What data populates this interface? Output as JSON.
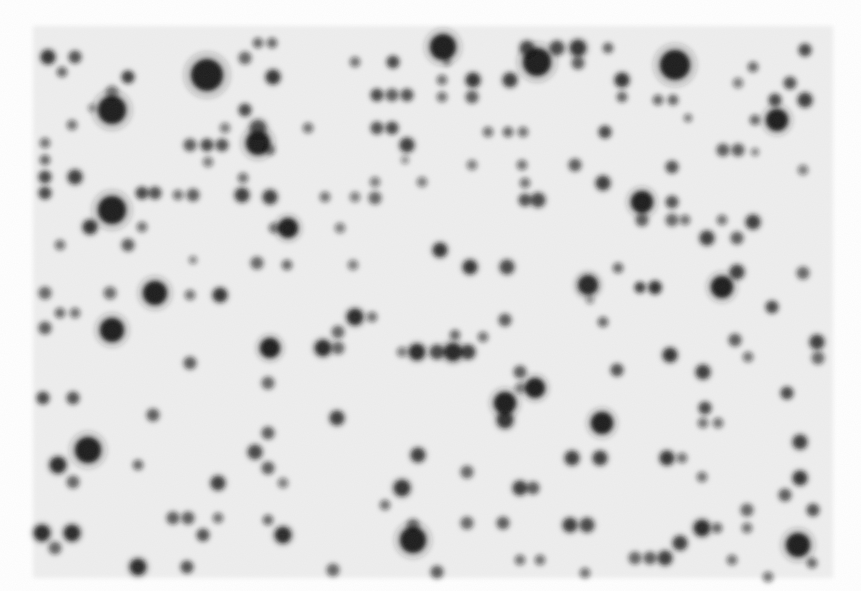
{
  "image": {
    "width": 861,
    "height": 591,
    "page_background": "#ffffff",
    "membrane": {
      "x": 33,
      "y": 26,
      "width": 800,
      "height": 552,
      "color": "#eeeeee"
    },
    "spot_color": "#1a1a1a",
    "spots": [
      [
        48,
        57,
        7,
        0.85
      ],
      [
        75,
        57,
        6,
        0.7
      ],
      [
        62,
        72,
        5,
        0.55
      ],
      [
        128,
        77,
        6,
        0.8
      ],
      [
        207,
        75,
        16,
        1.0
      ],
      [
        245,
        58,
        6,
        0.6
      ],
      [
        258,
        43,
        5,
        0.55
      ],
      [
        272,
        43,
        5,
        0.55
      ],
      [
        273,
        77,
        7,
        0.85
      ],
      [
        112,
        110,
        14,
        1.0
      ],
      [
        112,
        92,
        6,
        0.5
      ],
      [
        92,
        108,
        4,
        0.35
      ],
      [
        72,
        125,
        5,
        0.5
      ],
      [
        245,
        110,
        6,
        0.75
      ],
      [
        190,
        145,
        6,
        0.65
      ],
      [
        207,
        145,
        6,
        0.75
      ],
      [
        225,
        128,
        5,
        0.45
      ],
      [
        222,
        145,
        6,
        0.7
      ],
      [
        258,
        143,
        12,
        1.0
      ],
      [
        258,
        128,
        8,
        0.7
      ],
      [
        270,
        150,
        5,
        0.5
      ],
      [
        208,
        162,
        5,
        0.45
      ],
      [
        45,
        143,
        5,
        0.5
      ],
      [
        45,
        160,
        5,
        0.55
      ],
      [
        45,
        177,
        6,
        0.75
      ],
      [
        75,
        177,
        7,
        0.8
      ],
      [
        45,
        193,
        6,
        0.75
      ],
      [
        112,
        210,
        14,
        1.0
      ],
      [
        90,
        227,
        7,
        0.85
      ],
      [
        142,
        193,
        6,
        0.75
      ],
      [
        155,
        193,
        6,
        0.7
      ],
      [
        178,
        195,
        5,
        0.5
      ],
      [
        193,
        195,
        6,
        0.65
      ],
      [
        242,
        195,
        7,
        0.8
      ],
      [
        243,
        178,
        5,
        0.5
      ],
      [
        128,
        245,
        6,
        0.65
      ],
      [
        142,
        227,
        5,
        0.5
      ],
      [
        60,
        245,
        5,
        0.5
      ],
      [
        155,
        293,
        12,
        1.0
      ],
      [
        220,
        295,
        7,
        0.85
      ],
      [
        190,
        295,
        5,
        0.5
      ],
      [
        110,
        293,
        6,
        0.55
      ],
      [
        45,
        293,
        6,
        0.6
      ],
      [
        193,
        260,
        4,
        0.4
      ],
      [
        270,
        197,
        7,
        0.8
      ],
      [
        288,
        228,
        10,
        1.0
      ],
      [
        274,
        228,
        5,
        0.5
      ],
      [
        325,
        197,
        5,
        0.5
      ],
      [
        355,
        197,
        5,
        0.45
      ],
      [
        375,
        198,
        6,
        0.6
      ],
      [
        375,
        182,
        5,
        0.45
      ],
      [
        422,
        182,
        5,
        0.45
      ],
      [
        340,
        228,
        5,
        0.45
      ],
      [
        257,
        263,
        6,
        0.6
      ],
      [
        287,
        265,
        5,
        0.55
      ],
      [
        353,
        265,
        5,
        0.45
      ],
      [
        440,
        250,
        7,
        0.85
      ],
      [
        308,
        128,
        5,
        0.5
      ],
      [
        377,
        95,
        6,
        0.75
      ],
      [
        392,
        95,
        6,
        0.65
      ],
      [
        407,
        95,
        6,
        0.7
      ],
      [
        393,
        62,
        6,
        0.75
      ],
      [
        355,
        62,
        5,
        0.5
      ],
      [
        377,
        128,
        6,
        0.7
      ],
      [
        392,
        128,
        6,
        0.75
      ],
      [
        407,
        145,
        7,
        0.8
      ],
      [
        405,
        160,
        4,
        0.35
      ],
      [
        443,
        47,
        13,
        1.0
      ],
      [
        442,
        80,
        5,
        0.5
      ],
      [
        442,
        97,
        5,
        0.5
      ],
      [
        447,
        62,
        4,
        0.35
      ],
      [
        537,
        62,
        14,
        1.0
      ],
      [
        527,
        48,
        7,
        0.75
      ],
      [
        557,
        48,
        7,
        0.75
      ],
      [
        578,
        48,
        8,
        0.85
      ],
      [
        578,
        63,
        6,
        0.65
      ],
      [
        608,
        48,
        5,
        0.6
      ],
      [
        473,
        80,
        7,
        0.85
      ],
      [
        510,
        80,
        7,
        0.8
      ],
      [
        622,
        80,
        7,
        0.85
      ],
      [
        472,
        97,
        6,
        0.65
      ],
      [
        622,
        97,
        5,
        0.6
      ],
      [
        605,
        132,
        6,
        0.75
      ],
      [
        488,
        132,
        5,
        0.5
      ],
      [
        508,
        132,
        5,
        0.55
      ],
      [
        523,
        132,
        5,
        0.5
      ],
      [
        675,
        65,
        15,
        1.0
      ],
      [
        658,
        100,
        5,
        0.55
      ],
      [
        673,
        100,
        5,
        0.6
      ],
      [
        688,
        118,
        4,
        0.45
      ],
      [
        753,
        67,
        5,
        0.55
      ],
      [
        805,
        50,
        6,
        0.75
      ],
      [
        790,
        83,
        6,
        0.7
      ],
      [
        738,
        83,
        5,
        0.45
      ],
      [
        777,
        120,
        11,
        1.0
      ],
      [
        775,
        100,
        6,
        0.75
      ],
      [
        805,
        100,
        7,
        0.8
      ],
      [
        755,
        120,
        5,
        0.55
      ],
      [
        723,
        150,
        6,
        0.65
      ],
      [
        738,
        150,
        6,
        0.65
      ],
      [
        755,
        152,
        4,
        0.4
      ],
      [
        575,
        165,
        6,
        0.65
      ],
      [
        522,
        165,
        5,
        0.5
      ],
      [
        472,
        165,
        5,
        0.45
      ],
      [
        672,
        167,
        6,
        0.7
      ],
      [
        603,
        183,
        7,
        0.8
      ],
      [
        525,
        183,
        5,
        0.5
      ],
      [
        525,
        200,
        6,
        0.7
      ],
      [
        538,
        200,
        7,
        0.75
      ],
      [
        642,
        202,
        11,
        1.0
      ],
      [
        642,
        220,
        6,
        0.65
      ],
      [
        672,
        202,
        6,
        0.7
      ],
      [
        672,
        220,
        6,
        0.6
      ],
      [
        685,
        220,
        5,
        0.5
      ],
      [
        722,
        220,
        5,
        0.5
      ],
      [
        753,
        222,
        7,
        0.8
      ],
      [
        803,
        170,
        5,
        0.45
      ],
      [
        707,
        238,
        7,
        0.8
      ],
      [
        737,
        238,
        6,
        0.65
      ],
      [
        737,
        272,
        7,
        0.8
      ],
      [
        722,
        287,
        11,
        1.0
      ],
      [
        803,
        273,
        6,
        0.6
      ],
      [
        640,
        287,
        5,
        0.55
      ],
      [
        655,
        287,
        6,
        0.65
      ],
      [
        470,
        267,
        7,
        0.85
      ],
      [
        507,
        267,
        7,
        0.75
      ],
      [
        618,
        268,
        5,
        0.55
      ],
      [
        588,
        285,
        10,
        0.95
      ],
      [
        590,
        300,
        4,
        0.35
      ],
      [
        437,
        352,
        7,
        0.75
      ],
      [
        453,
        352,
        9,
        0.95
      ],
      [
        468,
        352,
        7,
        0.8
      ],
      [
        455,
        335,
        5,
        0.55
      ],
      [
        483,
        337,
        5,
        0.5
      ],
      [
        505,
        320,
        6,
        0.65
      ],
      [
        535,
        388,
        10,
        1.0
      ],
      [
        505,
        403,
        11,
        1.0
      ],
      [
        505,
        420,
        8,
        0.85
      ],
      [
        520,
        372,
        6,
        0.65
      ],
      [
        520,
        388,
        5,
        0.45
      ],
      [
        603,
        322,
        5,
        0.55
      ],
      [
        602,
        423,
        11,
        1.0
      ],
      [
        617,
        370,
        6,
        0.7
      ],
      [
        640,
        288,
        5,
        0.5
      ],
      [
        655,
        288,
        6,
        0.6
      ],
      [
        670,
        355,
        7,
        0.85
      ],
      [
        703,
        372,
        7,
        0.8
      ],
      [
        735,
        340,
        6,
        0.65
      ],
      [
        772,
        307,
        6,
        0.75
      ],
      [
        817,
        342,
        7,
        0.8
      ],
      [
        818,
        358,
        6,
        0.6
      ],
      [
        748,
        357,
        5,
        0.5
      ],
      [
        787,
        393,
        6,
        0.75
      ],
      [
        705,
        408,
        6,
        0.75
      ],
      [
        703,
        423,
        5,
        0.5
      ],
      [
        718,
        423,
        5,
        0.5
      ],
      [
        112,
        330,
        12,
        1.0
      ],
      [
        45,
        328,
        6,
        0.65
      ],
      [
        60,
        313,
        5,
        0.55
      ],
      [
        75,
        313,
        5,
        0.5
      ],
      [
        270,
        348,
        10,
        1.0
      ],
      [
        323,
        348,
        8,
        0.9
      ],
      [
        338,
        348,
        6,
        0.6
      ],
      [
        355,
        317,
        8,
        0.9
      ],
      [
        372,
        317,
        5,
        0.5
      ],
      [
        338,
        332,
        6,
        0.6
      ],
      [
        417,
        352,
        8,
        0.9
      ],
      [
        402,
        352,
        5,
        0.45
      ],
      [
        190,
        363,
        6,
        0.65
      ],
      [
        268,
        383,
        6,
        0.6
      ],
      [
        43,
        398,
        6,
        0.75
      ],
      [
        73,
        398,
        6,
        0.7
      ],
      [
        153,
        415,
        6,
        0.65
      ],
      [
        337,
        418,
        7,
        0.8
      ],
      [
        255,
        452,
        7,
        0.75
      ],
      [
        268,
        433,
        6,
        0.65
      ],
      [
        268,
        468,
        6,
        0.65
      ],
      [
        88,
        450,
        13,
        1.0
      ],
      [
        58,
        465,
        8,
        0.9
      ],
      [
        73,
        482,
        6,
        0.6
      ],
      [
        138,
        465,
        5,
        0.55
      ],
      [
        218,
        483,
        7,
        0.8
      ],
      [
        283,
        483,
        5,
        0.45
      ],
      [
        402,
        488,
        8,
        0.85
      ],
      [
        418,
        455,
        7,
        0.8
      ],
      [
        173,
        518,
        6,
        0.65
      ],
      [
        188,
        518,
        6,
        0.65
      ],
      [
        203,
        535,
        6,
        0.7
      ],
      [
        218,
        518,
        5,
        0.5
      ],
      [
        42,
        533,
        8,
        0.9
      ],
      [
        72,
        533,
        8,
        0.9
      ],
      [
        55,
        548,
        6,
        0.6
      ],
      [
        283,
        535,
        8,
        0.9
      ],
      [
        268,
        520,
        5,
        0.55
      ],
      [
        385,
        505,
        5,
        0.5
      ],
      [
        413,
        540,
        13,
        1.0
      ],
      [
        413,
        525,
        6,
        0.55
      ],
      [
        138,
        567,
        8,
        0.9
      ],
      [
        187,
        567,
        6,
        0.7
      ],
      [
        333,
        570,
        6,
        0.6
      ],
      [
        437,
        572,
        6,
        0.65
      ],
      [
        572,
        458,
        7,
        0.8
      ],
      [
        600,
        458,
        7,
        0.8
      ],
      [
        667,
        458,
        7,
        0.85
      ],
      [
        682,
        458,
        5,
        0.5
      ],
      [
        800,
        442,
        7,
        0.8
      ],
      [
        800,
        478,
        7,
        0.85
      ],
      [
        785,
        495,
        6,
        0.65
      ],
      [
        813,
        510,
        6,
        0.7
      ],
      [
        747,
        510,
        6,
        0.6
      ],
      [
        467,
        472,
        6,
        0.6
      ],
      [
        520,
        488,
        7,
        0.8
      ],
      [
        533,
        488,
        6,
        0.65
      ],
      [
        503,
        523,
        6,
        0.65
      ],
      [
        467,
        523,
        6,
        0.6
      ],
      [
        570,
        525,
        7,
        0.8
      ],
      [
        587,
        525,
        7,
        0.75
      ],
      [
        702,
        528,
        8,
        0.9
      ],
      [
        717,
        528,
        5,
        0.55
      ],
      [
        747,
        528,
        5,
        0.5
      ],
      [
        680,
        543,
        7,
        0.8
      ],
      [
        702,
        477,
        5,
        0.5
      ],
      [
        798,
        545,
        12,
        1.0
      ],
      [
        812,
        563,
        5,
        0.55
      ],
      [
        635,
        558,
        6,
        0.6
      ],
      [
        650,
        558,
        6,
        0.65
      ],
      [
        665,
        558,
        7,
        0.8
      ],
      [
        732,
        560,
        5,
        0.5
      ],
      [
        768,
        577,
        5,
        0.5
      ],
      [
        585,
        573,
        5,
        0.5
      ],
      [
        520,
        560,
        5,
        0.5
      ],
      [
        540,
        560,
        5,
        0.5
      ]
    ]
  }
}
